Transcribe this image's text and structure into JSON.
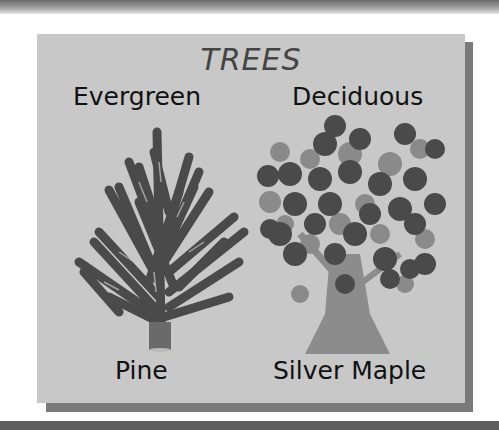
{
  "poster": {
    "title": "TREES",
    "categories": [
      {
        "heading": "Evergreen",
        "example": "Pine",
        "illustration": "pine-tree-icon"
      },
      {
        "heading": "Deciduous",
        "example": "Silver Maple",
        "illustration": "maple-tree-icon"
      }
    ]
  },
  "colors": {
    "card_background": "#c8c8c8",
    "card_shadow": "#7a7a7a",
    "foliage_dark": "#4a4a4a",
    "foliage_light": "#8a8a8a",
    "trunk": "#8c8c8c",
    "text": "#111111",
    "title_text": "#444444"
  }
}
